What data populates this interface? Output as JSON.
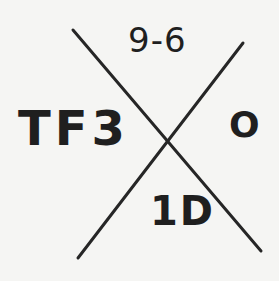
{
  "diagram": {
    "type": "x-cross-quadrant-label",
    "line_color": "#262626",
    "background_color": "#f5f5f3",
    "labels": {
      "top": "9-6",
      "left": "TF3",
      "right": "O",
      "bottom": "1D"
    },
    "lines": [
      {
        "name": "diagonal-descending",
        "x1": 73,
        "y1": 30,
        "x2": 261,
        "y2": 251
      },
      {
        "name": "diagonal-ascending",
        "x1": 243,
        "y1": 43,
        "x2": 78,
        "y2": 258
      }
    ]
  }
}
